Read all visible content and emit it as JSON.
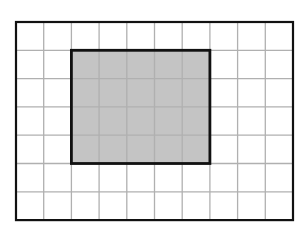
{
  "diagram": {
    "type": "grid-area",
    "grid": {
      "columns": 10,
      "rows": 7,
      "x0": 16,
      "y0": 22,
      "cell_w": 27.7,
      "cell_h": 28.3,
      "line_color": "#b0b0b0",
      "border_color": "#111111"
    },
    "shaded_rectangle": {
      "col_start": 2,
      "row_start": 1,
      "width_cells": 5,
      "height_cells": 4,
      "fill_color": "#c4c4c4",
      "border_color": "#111111"
    }
  }
}
